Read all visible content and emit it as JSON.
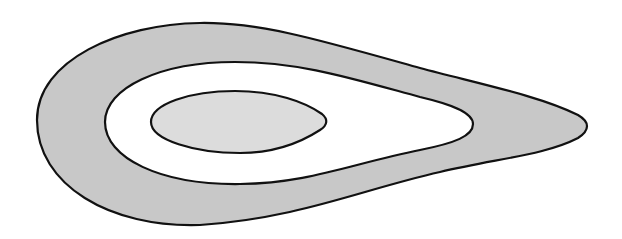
{
  "diagram": {
    "type": "nested-contours",
    "colors": {
      "background": "#ffffff",
      "outer_fill": "#c8c8c8",
      "middle_fill": "#ffffff",
      "inner_fill": "#dcdcdc",
      "stroke": "#111111"
    },
    "shapes": [
      {
        "id": "outer",
        "fill_key": "outer_fill",
        "path": "M 37 120 C 37 60, 120 24, 200 23 C 260 22, 320 40, 420 68 C 480 84, 540 96, 578 115 C 590 122, 590 130, 578 138 C 545 155, 500 158, 440 172 C 360 190, 300 218, 200 225 C 110 228, 37 185, 37 120 Z"
      },
      {
        "id": "middle",
        "fill_key": "middle_fill",
        "path": "M 105 122 C 105 88, 160 62, 235 62 C 300 62, 350 78, 420 97 C 450 104, 473 112, 473 124 C 473 136, 455 143, 420 150 C 350 164, 310 183, 240 184 C 160 185, 105 158, 105 122 Z"
      },
      {
        "id": "inner",
        "fill_key": "inner_fill",
        "path": "M 151 122 C 151 104, 190 91, 235 91 C 275 91, 305 102, 322 114 C 328 119, 328 125, 320 130 C 300 143, 275 153, 240 153 C 195 153, 151 140, 151 122 Z"
      }
    ]
  }
}
